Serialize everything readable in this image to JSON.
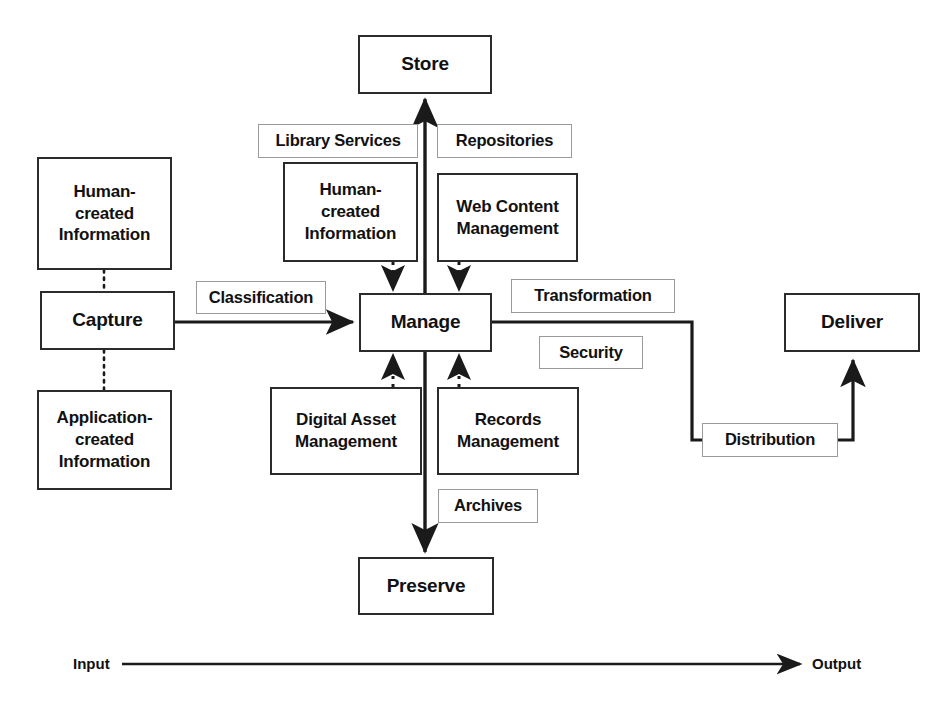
{
  "diagram": {
    "stages": [
      {
        "id": "store",
        "label": "Store"
      },
      {
        "id": "capture",
        "label": "Capture"
      },
      {
        "id": "manage",
        "label": "Manage"
      },
      {
        "id": "deliver",
        "label": "Deliver"
      },
      {
        "id": "preserve",
        "label": "Preserve"
      }
    ],
    "inputs": [
      {
        "id": "human-created-information-left",
        "label": "Human-\ncreated\nInformation"
      },
      {
        "id": "application-created-information-left",
        "label": "Application-\ncreated\nInformation"
      }
    ],
    "components": [
      {
        "id": "human-created-information-manage",
        "label": "Human-\ncreated\nInformation"
      },
      {
        "id": "web-content-management",
        "label": "Web Content\nManagement"
      },
      {
        "id": "digital-asset-management",
        "label": "Digital Asset\nManagement"
      },
      {
        "id": "records-management",
        "label": "Records\nManagement"
      }
    ],
    "tags": [
      {
        "id": "library-services",
        "label": "Library Services"
      },
      {
        "id": "repositories",
        "label": "Repositories"
      },
      {
        "id": "classification",
        "label": "Classification"
      },
      {
        "id": "transformation",
        "label": "Transformation"
      },
      {
        "id": "security",
        "label": "Security"
      },
      {
        "id": "archives",
        "label": "Archives"
      },
      {
        "id": "distribution",
        "label": "Distribution"
      }
    ],
    "flow_axis": {
      "input_label": "Input",
      "output_label": "Output"
    },
    "colors": {
      "background": "#ffffff",
      "text": "#111111",
      "thick_border": "#2b2b2b",
      "thin_border": "#9a9a9a",
      "connector": "#1a1a1a"
    }
  }
}
